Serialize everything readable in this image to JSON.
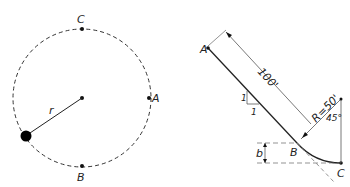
{
  "figure_left": {
    "description": "Circle with points A, B, C and radius r",
    "labels": {
      "top": "C",
      "right": "A",
      "bottom": "B",
      "radius": "r"
    }
  },
  "figure_right": {
    "description": "Inclined path A to B joining circular arc B to C",
    "labels": {
      "start": "A",
      "tangent": "B",
      "end": "C",
      "length": "100'",
      "radius": "R=50'",
      "angle": "45°",
      "slope_rise": "1",
      "slope_run": "1",
      "drop": "b"
    }
  },
  "colors": {
    "line": "#222222",
    "dim": "#666666",
    "background": "#ffffff"
  }
}
